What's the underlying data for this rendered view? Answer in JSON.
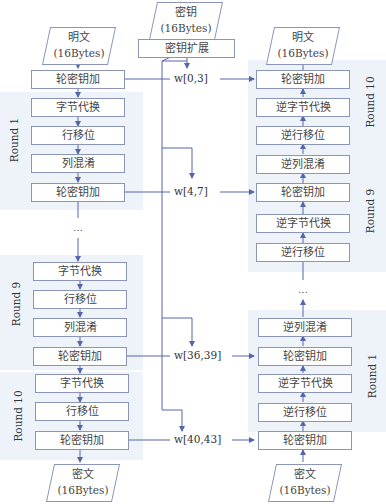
{
  "key": {
    "title": "密钥",
    "size": "(16Bytes)",
    "expansion": "密钥扩展"
  },
  "encrypt": {
    "input": {
      "title": "明文",
      "size": "(16Bytes)"
    },
    "output": {
      "title": "密文",
      "size": "(16Bytes)"
    },
    "initial": "轮密钥加",
    "round1": {
      "label": "Round 1",
      "steps": [
        "字节代换",
        "行移位",
        "列混淆",
        "轮密钥加"
      ]
    },
    "ellipsis": "…",
    "round9": {
      "label": "Round 9",
      "steps": [
        "字节代换",
        "行移位",
        "列混淆",
        "轮密钥加"
      ]
    },
    "round10": {
      "label": "Round 10",
      "steps": [
        "字节代换",
        "行移位",
        "轮密钥加"
      ]
    }
  },
  "decrypt": {
    "input": {
      "title": "密文",
      "size": "(16Bytes)"
    },
    "output": {
      "title": "明文",
      "size": "(16Bytes)"
    },
    "round10": {
      "label": "Round 10",
      "steps": [
        "轮密钥加",
        "逆字节代换",
        "逆行移位"
      ]
    },
    "round9": {
      "label": "Round 9",
      "steps": [
        "逆列混淆",
        "轮密钥加",
        "逆字节代换",
        "逆行移位"
      ]
    },
    "ellipsis": "…",
    "round1": {
      "label": "Round 1",
      "steps": [
        "逆列混淆",
        "轮密钥加",
        "逆字节代换",
        "逆行移位"
      ]
    },
    "final": "轮密钥加"
  },
  "round_keys": [
    "w[0,3]",
    "w[4,7]",
    "w[36,39]",
    "w[40,43]"
  ],
  "colors": {
    "line": "#5566aa",
    "box_border": "#8a95b8",
    "shade": "#eef3fa"
  }
}
